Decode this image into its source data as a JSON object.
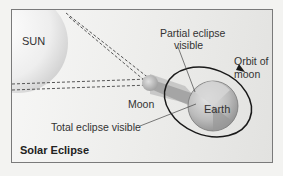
{
  "diagram": {
    "title": "Solar Eclipse",
    "bodies": {
      "sun": {
        "label": "SUN"
      },
      "moon": {
        "label": "Moon"
      },
      "earth": {
        "label": "Earth"
      }
    },
    "labels": {
      "partial": "Partial eclipse\nvisible",
      "partial_line1": "Partial eclipse",
      "partial_line2": "visible",
      "total": "Total eclipse visible",
      "orbit_line1": "Orbit of",
      "orbit_line2": "moon"
    },
    "colors": {
      "frame_border": "#7a7a7a",
      "orbit": "#1a1a1a",
      "dashed_rays": "#555555",
      "sun_fill": "#e4e4e4",
      "earth_fill": "#b9b9b9",
      "shadow": "#9a9a9a"
    }
  }
}
